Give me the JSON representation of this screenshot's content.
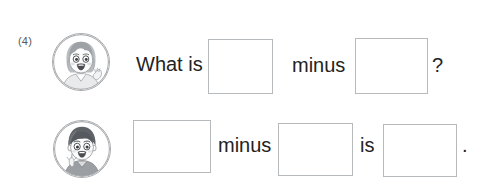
{
  "worksheet": {
    "item_number": "(4)",
    "background_color": "#ffffff",
    "text_color": "#232323",
    "box_border_color": "#b6babd",
    "avatar_border_color": "#a9acaf",
    "rows": [
      {
        "avatar": "girl-face-avatar",
        "sentence": "What is ___ minus ___ ?",
        "words": {
          "lead": "What is",
          "operator": "minus"
        },
        "punctuation": "?",
        "blanks": [
          {
            "name": "minuend",
            "value": ""
          },
          {
            "name": "subtrahend",
            "value": ""
          }
        ]
      },
      {
        "avatar": "boy-face-avatar",
        "sentence": "___ minus ___ is ___ .",
        "words": {
          "operator": "minus",
          "copula": "is"
        },
        "punctuation": ".",
        "blanks": [
          {
            "name": "minuend",
            "value": ""
          },
          {
            "name": "subtrahend",
            "value": ""
          },
          {
            "name": "difference",
            "value": ""
          }
        ]
      }
    ]
  }
}
